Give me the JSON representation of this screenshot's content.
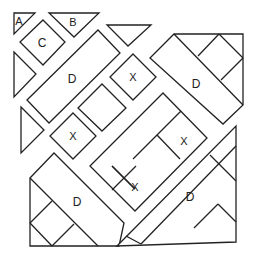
{
  "diagram": {
    "colors": {
      "stroke": "#222222",
      "fill": "#ffffff"
    },
    "pieces": [
      {
        "id": "A",
        "label": "A",
        "shape": "triangle"
      },
      {
        "id": "B",
        "label": "B",
        "shape": "triangle"
      },
      {
        "id": "C",
        "label": "C",
        "shape": "square"
      },
      {
        "id": "D1",
        "label": "D",
        "shape": "rectangle"
      },
      {
        "id": "D2",
        "label": "D",
        "shape": "rectangle"
      },
      {
        "id": "D3",
        "label": "D",
        "shape": "rectangle"
      },
      {
        "id": "D4",
        "label": "D",
        "shape": "rectangle"
      },
      {
        "id": "X1",
        "label": "X",
        "shape": "square"
      },
      {
        "id": "X2",
        "label": "X",
        "shape": "square"
      },
      {
        "id": "X3",
        "label": "X",
        "shape": "square"
      },
      {
        "id": "X4",
        "label": "X",
        "shape": "square"
      }
    ],
    "labels": {
      "a": "A",
      "b": "B",
      "c": "C",
      "d_upper_left": "D",
      "d_upper_right": "D",
      "d_lower_left": "D",
      "d_lower_right": "D",
      "x_top": "X",
      "x_left": "X",
      "x_center_right": "X",
      "x_center_bottom": "X"
    }
  }
}
